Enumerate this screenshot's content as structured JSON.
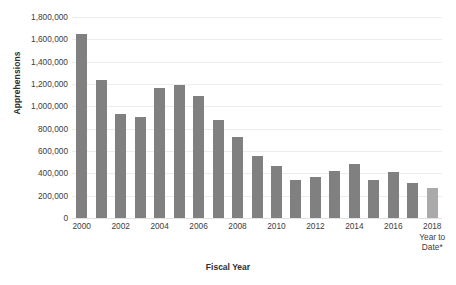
{
  "chart_data": {
    "type": "bar",
    "title": "",
    "xlabel": "Fiscal Year",
    "ylabel": "Apprehensions",
    "ylim": [
      0,
      1800000
    ],
    "ytick_values": [
      1800000,
      1600000,
      1400000,
      1200000,
      1000000,
      800000,
      600000,
      400000,
      200000,
      0
    ],
    "ytick_labels": [
      "1,800,000",
      "1,600,000",
      "1,400,000",
      "1,200,000",
      "1,000,000",
      "800,000",
      "600,000",
      "400,000",
      "200,000",
      "0"
    ],
    "grid": true,
    "legend": null,
    "categories": [
      "2000",
      "2001",
      "2002",
      "2003",
      "2004",
      "2005",
      "2006",
      "2007",
      "2008",
      "2009",
      "2010",
      "2011",
      "2012",
      "2013",
      "2014",
      "2015",
      "2016",
      "2017",
      "2018 Year to Date*"
    ],
    "values": [
      1643679,
      1235718,
      929809,
      905065,
      1160395,
      1189075,
      1089092,
      876704,
      723825,
      556041,
      463382,
      340252,
      364768,
      420789,
      486651,
      337117,
      415816,
      310531,
      265700
    ],
    "xtick_labels": [
      {
        "index": 0,
        "line1": "2000",
        "line2": "",
        "line3": ""
      },
      {
        "index": 2,
        "line1": "2002",
        "line2": "",
        "line3": ""
      },
      {
        "index": 4,
        "line1": "2004",
        "line2": "",
        "line3": ""
      },
      {
        "index": 6,
        "line1": "2006",
        "line2": "",
        "line3": ""
      },
      {
        "index": 8,
        "line1": "2008",
        "line2": "",
        "line3": ""
      },
      {
        "index": 10,
        "line1": "2010",
        "line2": "",
        "line3": ""
      },
      {
        "index": 12,
        "line1": "2012",
        "line2": "",
        "line3": ""
      },
      {
        "index": 14,
        "line1": "2014",
        "line2": "",
        "line3": ""
      },
      {
        "index": 16,
        "line1": "2016",
        "line2": "",
        "line3": ""
      },
      {
        "index": 18,
        "line1": "2018",
        "line2": "Year to",
        "line3": "Date*"
      }
    ],
    "bar_color": "#808080",
    "partial_bar_color": "#aaaaaa",
    "partial_bar_index": 18,
    "gridline_color": "#ededed",
    "background_color": "#ffffff"
  }
}
